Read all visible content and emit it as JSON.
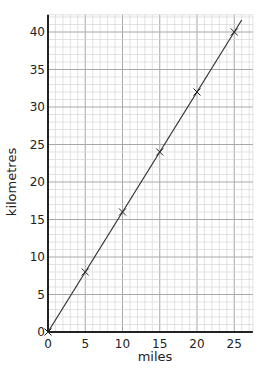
{
  "chart_data": {
    "type": "line",
    "title": "",
    "xlabel": "miles",
    "ylabel": "kilometres",
    "xlim": [
      0,
      27.5
    ],
    "ylim": [
      0,
      42.3
    ],
    "x_ticks": [
      0,
      5,
      10,
      15,
      20,
      25
    ],
    "y_ticks": [
      0,
      5,
      10,
      15,
      20,
      25,
      30,
      35,
      40
    ],
    "grid": {
      "minor_step": 1,
      "major_step": 5
    },
    "series": [
      {
        "name": "miles to kilometres",
        "x": [
          0,
          5,
          10,
          15,
          20,
          25
        ],
        "y": [
          0,
          8,
          16,
          24,
          32,
          40
        ],
        "marker": "x",
        "line_extends_to": [
          26,
          41.6
        ]
      }
    ],
    "colors": {
      "line": "#333333",
      "minor_grid": "#d6d6d6",
      "major_grid": "#a8a8a8",
      "axis": "#222222"
    }
  }
}
